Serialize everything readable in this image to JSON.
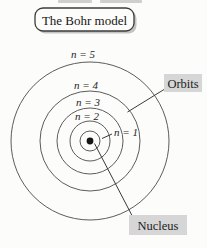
{
  "title": "The Bohr model",
  "diagram": {
    "type": "bohr-model",
    "orbit_count": 5,
    "orbits": [
      {
        "n": 1,
        "label": "n = 1"
      },
      {
        "n": 2,
        "label": "n = 2"
      },
      {
        "n": 3,
        "label": "n = 3"
      },
      {
        "n": 4,
        "label": "n = 4"
      },
      {
        "n": 5,
        "label": "n = 5"
      }
    ],
    "callouts": {
      "orbits": "Orbits",
      "nucleus": "Nucleus"
    }
  },
  "colors": {
    "background": "#fcfcfa",
    "orbit_stroke": "#5c5c5c",
    "nucleus_fill": "#151515",
    "callout_bg": "#d6d6d6",
    "text": "#1c1c1c",
    "title_border": "#3c3c3c",
    "title_shadow": "#c4c4c4"
  }
}
